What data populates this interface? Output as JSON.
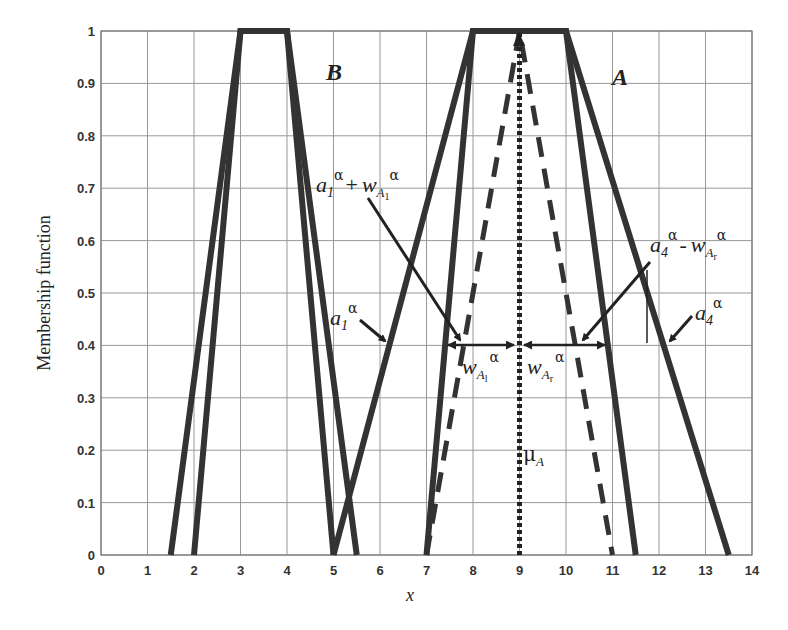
{
  "chart_data": {
    "type": "line",
    "title": "",
    "xlabel": "x",
    "ylabel": "Membership function",
    "xlim": [
      0,
      14
    ],
    "ylim": [
      0,
      1
    ],
    "grid": true,
    "x_ticks": [
      "0",
      "1",
      "2",
      "3",
      "4",
      "5",
      "6",
      "7",
      "8",
      "9",
      "10",
      "11",
      "12",
      "13",
      "14"
    ],
    "y_ticks": [
      "0",
      "0.1",
      "0.2",
      "0.3",
      "0.4",
      "0.5",
      "0.6",
      "0.7",
      "0.8",
      "0.9",
      "1"
    ],
    "series": [
      {
        "name": "B outer",
        "style": "solid",
        "points": [
          [
            1.5,
            0
          ],
          [
            3,
            1
          ],
          [
            4,
            1
          ],
          [
            5.5,
            0
          ]
        ]
      },
      {
        "name": "B inner",
        "style": "solid",
        "points": [
          [
            2,
            0
          ],
          [
            3,
            1
          ],
          [
            4,
            1
          ],
          [
            5,
            0
          ]
        ]
      },
      {
        "name": "A outer",
        "style": "solid",
        "points": [
          [
            5,
            0
          ],
          [
            8,
            1
          ],
          [
            10,
            1
          ],
          [
            13.5,
            0
          ]
        ]
      },
      {
        "name": "A inner",
        "style": "solid",
        "points": [
          [
            7,
            0
          ],
          [
            8,
            1
          ],
          [
            10,
            1
          ],
          [
            11.5,
            0
          ]
        ]
      },
      {
        "name": "A dashed triangle",
        "style": "dashed",
        "points": [
          [
            7,
            0
          ],
          [
            9,
            1
          ],
          [
            11,
            0
          ]
        ]
      },
      {
        "name": "mu_A",
        "style": "dotted",
        "points": [
          [
            9,
            0
          ],
          [
            9,
            1
          ]
        ]
      }
    ],
    "shape_labels": [
      {
        "text": "B",
        "x": 5.3,
        "y": 0.9
      },
      {
        "text": "A",
        "x": 11.6,
        "y": 0.9
      }
    ],
    "annotations": [
      {
        "text": "a1^α + w_A1^α",
        "arrow_to": [
          7.7,
          0.4
        ]
      },
      {
        "text": "a4^α - w_Ar^α",
        "arrow_to": [
          10.3,
          0.4
        ]
      },
      {
        "text": "a1^α",
        "arrow_to": [
          6.1,
          0.4
        ]
      },
      {
        "text": "a4^α",
        "arrow_to": [
          12.1,
          0.4
        ]
      },
      {
        "text": "w_A1^α",
        "span": [
          7.4,
          9
        ],
        "y": 0.4
      },
      {
        "text": "w_Ar^α",
        "span": [
          9,
          10.8
        ],
        "y": 0.4
      },
      {
        "text": "μ_A",
        "x": 9.1,
        "y": 0.2
      }
    ]
  },
  "labels": {
    "xlabel": "x",
    "ylabel": "Membership function",
    "B": "B",
    "A": "A",
    "a": "a",
    "w": "w",
    "alpha": "α",
    "mu": "μ",
    "sub1": "1",
    "sub4": "4",
    "subA": "A",
    "subl": "l",
    "subr": "r",
    "plus": "+",
    "minus": "-"
  }
}
